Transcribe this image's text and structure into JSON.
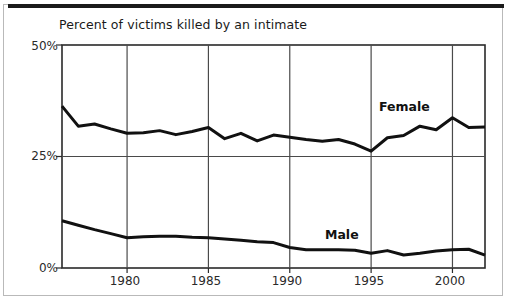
{
  "figure": {
    "title": "Percent of victims killed by an intimate",
    "background_color": "#ffffff",
    "border_color": "#b9b9b9",
    "top_rule_color": "#1a1a1a",
    "line_color": "#111111",
    "grid_color": "#4a4a4a"
  },
  "axes": {
    "y_ticks": [
      "50%",
      "25%",
      "0%"
    ],
    "x_ticks": [
      "1980",
      "1985",
      "1990",
      "1995",
      "2000"
    ]
  },
  "series_labels": {
    "female": "Female",
    "male": "Male"
  },
  "chart_data": {
    "type": "line",
    "title": "Percent of victims killed by an intimate",
    "xlabel": "",
    "ylabel": "",
    "ylim": [
      0,
      50
    ],
    "xlim": [
      1976,
      2002
    ],
    "ytick_values": [
      0,
      25,
      50
    ],
    "ytick_labels": [
      "0%",
      "25%",
      "50%"
    ],
    "xtick_values": [
      1980,
      1985,
      1990,
      1995,
      2000
    ],
    "xtick_labels": [
      "1980",
      "1985",
      "1990",
      "1995",
      "2000"
    ],
    "grid": true,
    "legend": "inline-labels",
    "x": [
      1976,
      1977,
      1978,
      1979,
      1980,
      1981,
      1982,
      1983,
      1984,
      1985,
      1986,
      1987,
      1988,
      1989,
      1990,
      1991,
      1992,
      1993,
      1994,
      1995,
      1996,
      1997,
      1998,
      1999,
      2000,
      2001,
      2002
    ],
    "series": [
      {
        "name": "Female",
        "values": [
          36.3,
          31.8,
          32.3,
          31.2,
          30.2,
          30.3,
          30.8,
          29.9,
          30.6,
          31.5,
          29.0,
          30.2,
          28.5,
          29.8,
          29.3,
          28.8,
          28.4,
          28.8,
          27.8,
          26.2,
          29.2,
          29.7,
          31.8,
          31.0,
          33.7,
          31.5,
          31.6
        ]
      },
      {
        "name": "Male",
        "values": [
          10.6,
          9.6,
          8.6,
          7.7,
          6.8,
          7.0,
          7.1,
          7.1,
          6.9,
          6.8,
          6.5,
          6.2,
          5.9,
          5.7,
          4.6,
          4.1,
          4.1,
          4.1,
          4.0,
          3.3,
          3.9,
          2.9,
          3.3,
          3.8,
          4.1,
          4.2,
          2.9
        ]
      }
    ],
    "annotations": [
      {
        "text": "Female",
        "x": 1995.5,
        "y": 38.0
      },
      {
        "text": "Male",
        "x": 1991.5,
        "y": 10.5
      }
    ]
  }
}
